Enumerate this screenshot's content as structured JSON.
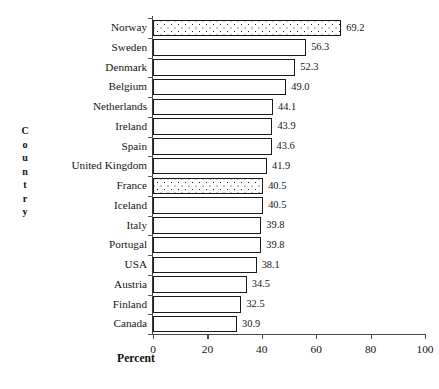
{
  "chart_data": {
    "type": "bar",
    "orientation": "horizontal",
    "title": "",
    "xlabel": "Percent",
    "ylabel": "Country",
    "xlim": [
      0,
      100
    ],
    "xticks": [
      "0",
      "20",
      "40",
      "60",
      "80",
      "100"
    ],
    "grid": false,
    "legend": null,
    "categories": [
      "Norway",
      "Sweden",
      "Denmark",
      "Belgium",
      "Netherlands",
      "Ireland",
      "Spain",
      "United Kingdom",
      "France",
      "Iceland",
      "Italy",
      "Portugal",
      "USA",
      "Austria",
      "Finland",
      "Canada"
    ],
    "values": [
      69.2,
      56.3,
      52.3,
      49.0,
      44.1,
      43.9,
      43.6,
      41.9,
      40.5,
      40.5,
      39.8,
      39.8,
      38.1,
      34.5,
      32.5,
      30.9
    ],
    "value_labels": [
      "69.2",
      "56.3",
      "52.3",
      "49.0",
      "44.1",
      "43.9",
      "43.6",
      "41.9",
      "40.5",
      "40.5",
      "39.8",
      "39.8",
      "38.1",
      "34.5",
      "32.5",
      "30.9"
    ],
    "bar_fills": [
      "dotted",
      "plain",
      "plain",
      "plain",
      "plain",
      "plain",
      "plain",
      "plain",
      "dotted",
      "plain",
      "plain",
      "plain",
      "plain",
      "plain",
      "plain",
      "plain"
    ],
    "colors": {
      "bar_outline": "#1a1a1a",
      "bar_plain_fill": "#ffffff",
      "bar_pattern_dot": "#1c1c1c",
      "axis": "#4a4a4a",
      "text": "#141414",
      "background": "#ffffff"
    }
  },
  "axis_title_letters": {
    "ylabel_letters": [
      "C",
      "o",
      "u",
      "n",
      "t",
      "r",
      "y"
    ]
  }
}
